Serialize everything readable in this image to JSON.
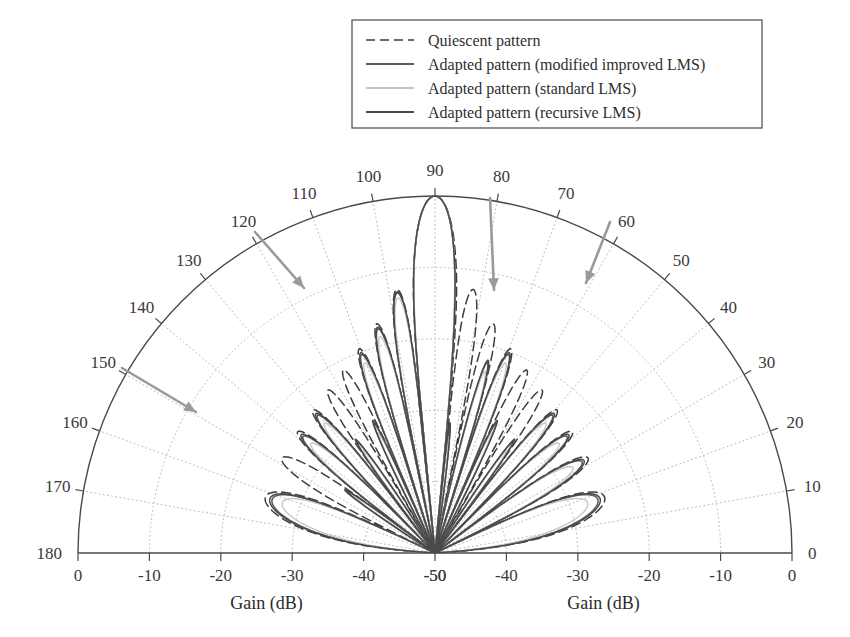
{
  "figure": {
    "kind": "polar-antenna-pattern",
    "background_color": "#ffffff",
    "ink_color": "#3a3a3a"
  },
  "legend": {
    "position": "top-center",
    "border_color": "#4a4a4a",
    "entries": [
      {
        "label": "Quiescent pattern",
        "style": "dashed",
        "color": "#3d3d3d",
        "sample": "dashed-line-sample"
      },
      {
        "label": "Adapted pattern (modified improved LMS)",
        "style": "solid",
        "color": "#5c5c5c",
        "sample": "solid-line-sample"
      },
      {
        "label": "Adapted pattern (standard LMS)",
        "style": "solid-faint",
        "color": "#c2c2c2",
        "sample": "faint-line-sample"
      },
      {
        "label": "Adapted pattern (recursive LMS)",
        "style": "solid",
        "color": "#4a4a4a",
        "sample": "solid-line-sample"
      }
    ]
  },
  "chart_data": {
    "type": "line",
    "subtype": "polar-half-plane",
    "title": "",
    "xlabel": "Gain (dB)",
    "ylabel": "",
    "grid": true,
    "legend_position": "top",
    "angle_axis": {
      "label": "",
      "unit": "degrees",
      "range": [
        0,
        180
      ],
      "tick_step": 10,
      "tick_labels": [
        "0",
        "10",
        "20",
        "30",
        "40",
        "50",
        "60",
        "70",
        "80",
        "90",
        "100",
        "110",
        "120",
        "130",
        "140",
        "150",
        "160",
        "170",
        "180"
      ]
    },
    "radial_axis": {
      "label": "Gain (dB)",
      "range": [
        -50,
        0
      ],
      "center_value": -50,
      "edge_value": 0,
      "tick_step": 10,
      "left_tick_labels": [
        "0",
        "-10",
        "-20",
        "-30",
        "-40",
        "-50"
      ],
      "right_tick_labels": [
        "-50",
        "-40",
        "-30",
        "-20",
        "-10",
        "0"
      ]
    },
    "nulls": [
      {
        "angle_deg": 150,
        "arrow": "arrow-null-150"
      },
      {
        "angle_deg": 120,
        "arrow": "arrow-null-120"
      },
      {
        "angle_deg": 80,
        "arrow": "arrow-null-80"
      },
      {
        "angle_deg": 60,
        "arrow": "arrow-null-60"
      }
    ],
    "arrow_color": "#9a9a9a",
    "series": [
      {
        "name": "Quiescent pattern",
        "color": "#3d3d3d",
        "style": "dashed",
        "width": 1.5,
        "main_lobe_deg": 90,
        "sidelobe_peaks_deg": [
          12,
          30,
          48,
          66,
          78,
          102,
          114,
          132,
          150,
          168
        ],
        "sidelobe_peaks_db": [
          -16,
          -22,
          -20,
          -24,
          -14,
          -14,
          -24,
          -20,
          -22,
          -16
        ],
        "nulls_deg": [
          6,
          20,
          38,
          56,
          72,
          84,
          96,
          108,
          124,
          142,
          160,
          174
        ],
        "null_depth_db": -50
      },
      {
        "name": "Adapted pattern (modified improved LMS)",
        "color": "#5c5c5c",
        "style": "solid",
        "width": 1.6,
        "main_lobe_deg": 90,
        "sidelobe_peaks_deg": [
          14,
          32,
          50,
          68,
          104,
          116,
          134,
          152,
          170
        ],
        "sidelobe_peaks_db": [
          -18,
          -24,
          -21,
          -12,
          -12,
          -21,
          -24,
          -18,
          -17
        ],
        "imposed_nulls_deg": [
          60,
          80,
          120,
          150
        ],
        "null_depth_db": -50
      },
      {
        "name": "Adapted pattern (standard LMS)",
        "color": "#c6c6c6",
        "style": "solid",
        "width": 1.4,
        "main_lobe_deg": 90,
        "sidelobe_peaks_deg": [
          14,
          32,
          50,
          68,
          104,
          116,
          134,
          152,
          170
        ],
        "sidelobe_peaks_db": [
          -20,
          -25,
          -22,
          -13,
          -13,
          -22,
          -25,
          -20,
          -19
        ],
        "imposed_nulls_deg": [
          60,
          80,
          120,
          150
        ],
        "null_depth_db": -45
      },
      {
        "name": "Adapted pattern (recursive LMS)",
        "color": "#4a4a4a",
        "style": "solid",
        "width": 1.5,
        "main_lobe_deg": 90,
        "sidelobe_peaks_deg": [
          14,
          32,
          50,
          68,
          104,
          116,
          134,
          152,
          170
        ],
        "sidelobe_peaks_db": [
          -18,
          -24,
          -21,
          -12,
          -12,
          -21,
          -24,
          -18,
          -17
        ],
        "imposed_nulls_deg": [
          60,
          80,
          120,
          150
        ],
        "null_depth_db": -50
      }
    ]
  },
  "axis_titles": {
    "left": "Gain (dB)",
    "right": "Gain (dB)"
  },
  "geometry": {
    "center_x": 435,
    "center_y": 553,
    "radius": 357
  }
}
